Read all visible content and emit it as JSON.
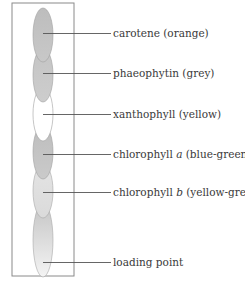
{
  "diagram": {
    "type": "chromatography-strip",
    "frame": {
      "x": 12,
      "y": 3,
      "width": 62,
      "height": 273,
      "stroke": "#8a8a8a"
    },
    "spots": [
      {
        "name": "carotene",
        "top": 8,
        "height": 52,
        "fill_top": "#bdbdbd",
        "fill_bottom": "#c8c8c8",
        "leader_y": 33
      },
      {
        "name": "phaeophytin",
        "top": 48,
        "height": 52,
        "fill_top": "#c4c4c4",
        "fill_bottom": "#cdcdcd",
        "leader_y": 73
      },
      {
        "name": "xanthophyll",
        "top": 88,
        "height": 52,
        "fill_top": "#ffffff",
        "fill_bottom": "#ffffff",
        "leader_y": 114
      },
      {
        "name": "chlorophyll-a",
        "top": 125,
        "height": 52,
        "fill_top": "#bdbdbd",
        "fill_bottom": "#cacaca",
        "leader_y": 154
      },
      {
        "name": "chlorophyll-b",
        "top": 164,
        "height": 52,
        "fill_top": "#e2e2e2",
        "fill_bottom": "#dcdcdc",
        "leader_y": 192
      },
      {
        "name": "loading-point",
        "top": 203,
        "height": 75,
        "fill_top": "#c6c6c6",
        "fill_bottom": "#f2f2f2",
        "leader_y": 262
      }
    ],
    "labels": [
      {
        "text": "carotene (orange)",
        "y": 33
      },
      {
        "pre": "phaeophytin (grey)",
        "y": 73
      },
      {
        "pre": "xanthophyll (yellow)",
        "y": 114
      },
      {
        "pre": "chlorophyll ",
        "ital": "a",
        "post": " (blue-green)",
        "y": 154
      },
      {
        "pre": "chlorophyll ",
        "ital": "b",
        "post": " (yellow-green)",
        "y": 192
      },
      {
        "pre": "loading point",
        "y": 262
      }
    ],
    "label_text": {
      "carotene": "carotene (orange)",
      "phaeophytin": "phaeophytin (grey)",
      "xanthophyll": "xanthophyll (yellow)",
      "chlorophyll_a_pre": "chlorophyll ",
      "chlorophyll_a_ital": "a",
      "chlorophyll_a_post": " (blue-green)",
      "chlorophyll_b_pre": "chlorophyll ",
      "chlorophyll_b_ital": "b",
      "chlorophyll_b_post": " (yellow-green)",
      "loading_point": "loading point"
    },
    "colors": {
      "line": "#555555",
      "spot_stroke": "#9a9a9a",
      "text": "#3a3a3a"
    }
  }
}
